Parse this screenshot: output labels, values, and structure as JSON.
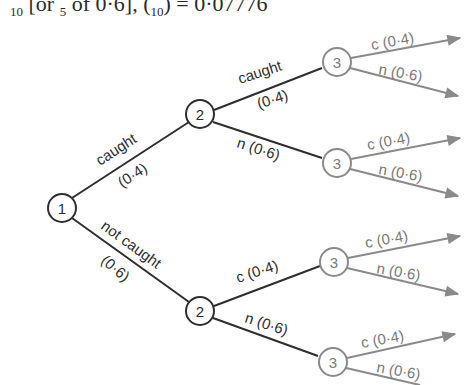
{
  "header": {
    "formula_fragment_1": "10",
    "formula_fragment_2": " [or ",
    "formula_fragment_3": "5",
    "formula_fragment_4": " of 0·6],    (",
    "formula_fragment_5": "10",
    "formula_fragment_6": ")  =  0·07776"
  },
  "tree": {
    "colors": {
      "primary": "#2e2e2e",
      "secondary": "#8a8a8a"
    },
    "nodes": [
      {
        "id": "n1",
        "label": "1"
      },
      {
        "id": "n2a",
        "label": "2"
      },
      {
        "id": "n2b",
        "label": "2"
      },
      {
        "id": "n3a",
        "label": "3"
      },
      {
        "id": "n3b",
        "label": "3"
      },
      {
        "id": "n3c",
        "label": "3"
      },
      {
        "id": "n3d",
        "label": "3"
      }
    ],
    "edges": {
      "e1_top_word": "caught",
      "e1_top_prob": "(0·4)",
      "e1_bot_word": "not caught",
      "e1_bot_prob": "(0·6)",
      "e2a_top_word": "caught",
      "e2a_top_prob": "(0·4)",
      "e2a_bot": "n (0·6)",
      "e2b_top": "c (0·4)",
      "e2b_bot": "n (0·6)",
      "e3_c": "c (0·4)",
      "e3_n": "n (0·6)"
    }
  }
}
